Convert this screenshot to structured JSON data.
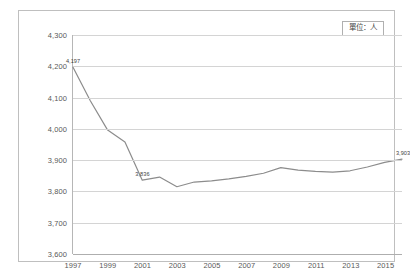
{
  "annotation": {
    "unit_label": "單位：人"
  },
  "chart_data": {
    "type": "line",
    "title": "",
    "subtitle": "",
    "xlabel": "",
    "ylabel": "",
    "unit_note": "單位：人",
    "grid": true,
    "legend_position": "none",
    "xlim": [
      1997,
      2016
    ],
    "ylim": [
      3600,
      4300
    ],
    "ytick_step": 100,
    "ytick_labels": [
      "4,300",
      "4,200",
      "4,100",
      "4,000",
      "3,900",
      "3,800",
      "3,700",
      "3,600"
    ],
    "ytick_values": [
      4300,
      4200,
      4100,
      4000,
      3900,
      3800,
      3700,
      3600
    ],
    "xtick_labels": [
      "1997",
      "1999",
      "2001",
      "2003",
      "2005",
      "2007",
      "2009",
      "2011",
      "2013",
      "2015"
    ],
    "xtick_values": [
      1997,
      1999,
      2001,
      2003,
      2005,
      2007,
      2009,
      2011,
      2013,
      2015
    ],
    "x": [
      1997,
      1998,
      1999,
      2000,
      2001,
      2002,
      2003,
      2004,
      2005,
      2006,
      2007,
      2008,
      2009,
      2010,
      2011,
      2012,
      2013,
      2014,
      2015,
      2016
    ],
    "series": [
      {
        "name": "人數",
        "color": "#8c8c8c",
        "values": [
          4197,
          4090,
          3996,
          3958,
          3836,
          3846,
          3815,
          3830,
          3834,
          3840,
          3848,
          3858,
          3876,
          3868,
          3864,
          3862,
          3866,
          3878,
          3893,
          3903
        ]
      }
    ],
    "point_labels": [
      {
        "x": 1997,
        "y": 4197,
        "text": "4,197"
      },
      {
        "x": 2001,
        "y": 3836,
        "text": "3,836"
      },
      {
        "x": 2016,
        "y": 3903,
        "text": "3,903"
      }
    ]
  }
}
